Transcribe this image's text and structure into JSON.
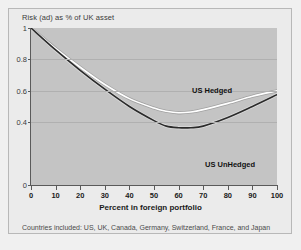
{
  "chart_title": "Risk (ad) as % of UK asset",
  "footnote": "Countries included: US, UK, Canada, Germany, Switzerland, France, and Japan",
  "colors": {
    "page_background": "#f0f0f0",
    "frame_background": "#ebebeb",
    "plot_background": "#c4c4c4",
    "gridline": "#b0b0b0",
    "axis": "#5a5a5a",
    "hedged_line": "#ffffff",
    "unhedged_line": "#2b2b2b"
  },
  "axes": {
    "y_ticks": [
      "1",
      "0.8",
      "0.6",
      "0.4",
      "0"
    ],
    "y_tick_values": [
      1,
      0.8,
      0.6,
      0.4,
      0
    ],
    "x_ticks": [
      "0",
      "10",
      "20",
      "30",
      "40",
      "50",
      "60",
      "70",
      "80",
      "90",
      "100"
    ],
    "x_tick_values": [
      0,
      10,
      20,
      30,
      40,
      50,
      60,
      70,
      80,
      90,
      100
    ],
    "xlabel": "Percent in foreign portfolio",
    "ylabel": ""
  },
  "series_labels": {
    "hedged": "US Hedged",
    "unhedged": "US UnHedged"
  },
  "chart_data": {
    "type": "line",
    "title": "Risk (ad) as % of UK asset",
    "xlabel": "Percent in foreign portfolio",
    "ylabel": "Risk (ad) as % of UK asset",
    "xlim": [
      0,
      100
    ],
    "ylim": [
      0,
      1
    ],
    "grid": true,
    "legend_position": "inline-annotations",
    "annotations": [
      "US Hedged",
      "US UnHedged"
    ],
    "note": "Countries included: US, UK, Canada, Germany, Switzerland, France, and Japan",
    "x": [
      0,
      10,
      20,
      30,
      40,
      50,
      55,
      60,
      65,
      70,
      80,
      90,
      100
    ],
    "series": [
      {
        "name": "US Hedged",
        "color": "#ffffff",
        "values": [
          1.0,
          0.87,
          0.75,
          0.64,
          0.55,
          0.49,
          0.47,
          0.46,
          0.465,
          0.48,
          0.52,
          0.565,
          0.6
        ]
      },
      {
        "name": "US UnHedged",
        "color": "#2b2b2b",
        "values": [
          1.0,
          0.86,
          0.73,
          0.61,
          0.5,
          0.41,
          0.375,
          0.365,
          0.365,
          0.375,
          0.43,
          0.5,
          0.575
        ]
      }
    ]
  }
}
